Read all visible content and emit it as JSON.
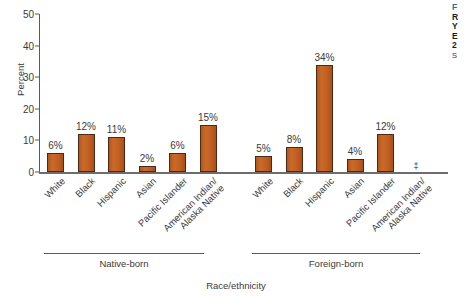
{
  "chart_data": {
    "type": "bar",
    "title": "",
    "xlabel": "Race/ethnicity",
    "ylabel": "Percent",
    "ylim": [
      0,
      50
    ],
    "yticks": [
      0,
      10,
      20,
      30,
      40,
      50
    ],
    "grid": false,
    "legend": "none",
    "groups": [
      "Native-born",
      "Foreign-born"
    ],
    "categories": [
      "White",
      "Black",
      "Hispanic",
      "Asian",
      "Pacific Islander",
      "American Indian/\nAlaska Native"
    ],
    "series": [
      {
        "name": "Native-born",
        "values": [
          6,
          12,
          11,
          2,
          6,
          15
        ],
        "labels": [
          "6%",
          "12%",
          "11%",
          "2%",
          "6%",
          "15%"
        ]
      },
      {
        "name": "Foreign-born",
        "values": [
          5,
          8,
          34,
          4,
          12,
          null
        ],
        "labels": [
          "5%",
          "8%",
          "34%",
          "4%",
          "12%",
          ""
        ]
      }
    ],
    "annotations": [
      {
        "text": "‡",
        "group": "Foreign-born",
        "category": "American Indian/\nAlaska Native",
        "note": "footnote marker shown in place of a bar"
      }
    ],
    "colors": {
      "bar_fill": "#c4601f",
      "bar_edge": "#4a2a14",
      "axis": "#5a5a5a",
      "text": "#3a3a3a",
      "caption_accent": "#2e6da4"
    }
  },
  "side_caption": {
    "line1": "F",
    "line2": "R",
    "line3": "Y",
    "line4": "E",
    "line5": "2",
    "line6": "S"
  }
}
